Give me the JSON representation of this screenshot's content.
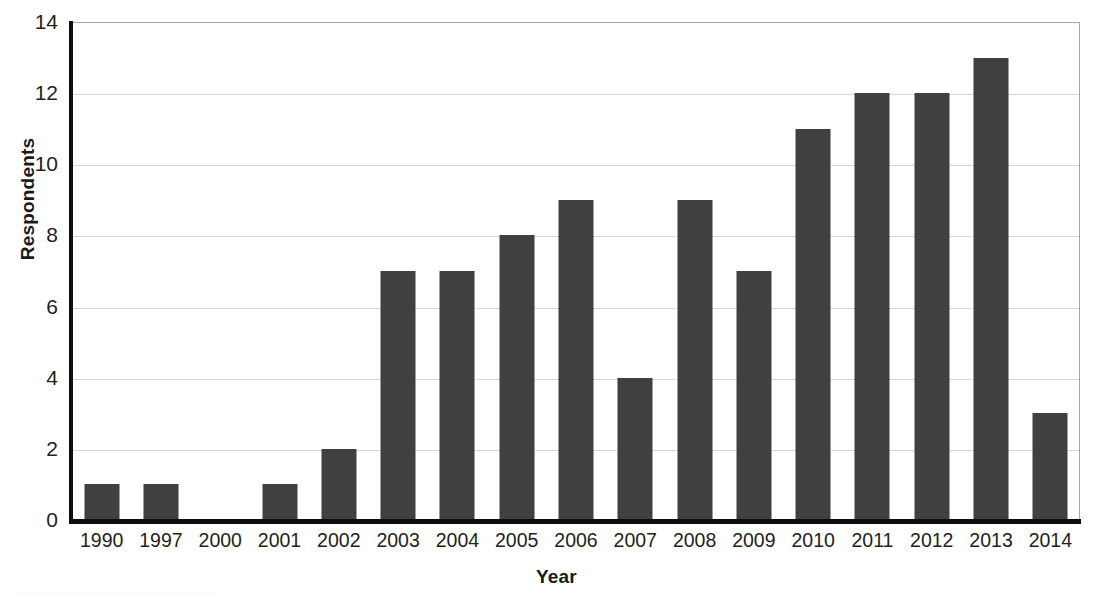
{
  "chart_data": {
    "type": "bar",
    "title": "",
    "subtitle": "",
    "xlabel": "Year",
    "ylabel": "Respondents",
    "categories": [
      "1990",
      "1997",
      "2000",
      "2001",
      "2002",
      "2003",
      "2004",
      "2005",
      "2006",
      "2007",
      "2008",
      "2009",
      "2010",
      "2011",
      "2012",
      "2013",
      "2014"
    ],
    "values": [
      1,
      1,
      0,
      1,
      2,
      7,
      7,
      8,
      9,
      4,
      9,
      7,
      11,
      12,
      12,
      13,
      3
    ],
    "ylim": [
      0,
      14
    ],
    "yticks": [
      0,
      2,
      4,
      6,
      8,
      10,
      12,
      14
    ],
    "ytick_labels": [
      "0",
      "2",
      "4",
      "6",
      "8",
      "10",
      "12",
      "14"
    ],
    "grid": true,
    "grid_axis": "y",
    "legend": false,
    "legend_position": "none",
    "bar_color": "#404040",
    "gridline_color": "#d7d7d7",
    "axis_color": "#0d0d0d",
    "plot_border_color": "#a6a6a6",
    "background_color": "#ffffff"
  },
  "axes": {
    "y_title": "Respondents",
    "x_title": "Year"
  }
}
